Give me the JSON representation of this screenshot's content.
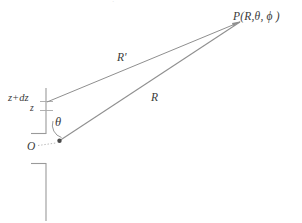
{
  "figure": {
    "kind": "geometry-diagram",
    "background_color": "#ffffff",
    "stroke_color": "#8a8a8a",
    "text_color": "#3a3a3a",
    "width": 302,
    "height": 223
  },
  "labels": {
    "point_p": "P(R,θ, ϕ )",
    "r_prime": "R'",
    "r": "R",
    "z_plus_dz": "z+dz",
    "z": "z",
    "theta": "θ",
    "origin": "O",
    "top_artifact": "·"
  },
  "geometry": {
    "point_p": {
      "x": 240,
      "y": 22
    },
    "origin_point": {
      "x": 59,
      "y": 141
    },
    "source_point": {
      "x": 47,
      "y": 102
    },
    "axis_x": 46,
    "axis_top_y": 88,
    "axis_bottom_y": 134,
    "tick_zdz_y": 101,
    "tick_z_y": 110,
    "lower_axis_top_y": 163,
    "lower_axis_bottom_y": 221,
    "lower_corner_x": 46,
    "lower_tick_left_x": 31,
    "upper_tick_left_x": 31,
    "upper_tick_y": 133,
    "dotted_o_from": {
      "x": 38,
      "y": 146
    },
    "dotted_o_to": {
      "x": 56,
      "y": 143
    },
    "theta_arc": "arc from vertical axis to R ray about the origin"
  },
  "lines": [
    {
      "name": "r-prime-line",
      "from": "source_point",
      "to": "point_p",
      "label": "R'"
    },
    {
      "name": "r-line",
      "from": "origin_point",
      "to": "point_p",
      "label": "R"
    }
  ]
}
